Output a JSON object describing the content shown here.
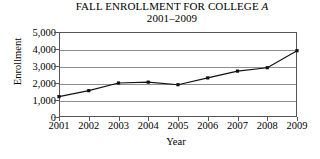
{
  "chart_data": {
    "type": "line",
    "title": "FALL ENROLLMENT FOR COLLEGE A",
    "title_prefix": "FALL ENROLLMENT FOR COLLEGE ",
    "title_italic_suffix": "A",
    "subtitle": "2001–2009",
    "xlabel": "Year",
    "ylabel": "Enrollment",
    "categories": [
      "2001",
      "2002",
      "2003",
      "2004",
      "2005",
      "2006",
      "2007",
      "2008",
      "2009"
    ],
    "x": [
      2001,
      2002,
      2003,
      2004,
      2005,
      2006,
      2007,
      2008,
      2009
    ],
    "values": [
      1200,
      1550,
      2000,
      2050,
      1900,
      2300,
      2700,
      2900,
      3900
    ],
    "ylim": [
      0,
      5000
    ],
    "xlim": [
      2001,
      2009
    ],
    "yticks": [
      0,
      1000,
      2000,
      3000,
      4000,
      5000
    ],
    "ytick_labels": [
      "0",
      "1,000",
      "2,000",
      "3,000",
      "4,000",
      "5,000"
    ],
    "grid": "horizontal",
    "legend": "none",
    "marker": "square",
    "line_color": "#111111",
    "grid_color": "#8d8d8d",
    "axis_color": "#565656"
  }
}
